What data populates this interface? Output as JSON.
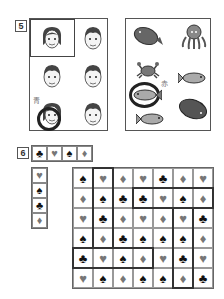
{
  "section5": {
    "number": "5",
    "faces_panel": {
      "highlighted_cell": "top-left woman",
      "faces": [
        {
          "id": "woman",
          "row": 1,
          "col": 1
        },
        {
          "id": "man",
          "row": 1,
          "col": 2
        },
        {
          "id": "man",
          "row": 2,
          "col": 1
        },
        {
          "id": "man",
          "row": 2,
          "col": 2
        },
        {
          "id": "woman-circled",
          "row": 3,
          "col": 1
        },
        {
          "id": "man",
          "row": 3,
          "col": 2
        }
      ],
      "circle_label": "青"
    },
    "sea_panel": {
      "creatures": [
        {
          "id": "flatfish",
          "pos": "top-left"
        },
        {
          "id": "octopus",
          "pos": "top-right"
        },
        {
          "id": "crab",
          "pos": "middle-left"
        },
        {
          "id": "fish",
          "pos": "middle-right"
        },
        {
          "id": "fish-circled",
          "pos": "lower-left"
        },
        {
          "id": "flatfish-dark",
          "pos": "lower-right"
        },
        {
          "id": "fish",
          "pos": "bottom-left"
        }
      ],
      "circle_label": "赤"
    }
  },
  "section6": {
    "number": "6",
    "top_strip": [
      "♣",
      "♥",
      "♠",
      "♦"
    ],
    "left_strip": [
      "♥",
      "♠",
      "♣",
      "♦"
    ],
    "grid": [
      [
        "♠",
        "♥",
        "♦",
        "♥",
        "♣",
        "♦",
        "♥"
      ],
      [
        "♦",
        "♠",
        "♣",
        "♣",
        "♥",
        "♠",
        "♦"
      ],
      [
        "♥",
        "♣",
        "♦",
        "♥",
        "♦",
        "♥",
        "♣"
      ],
      [
        "♠",
        "♦",
        "♣",
        "♠",
        "♠",
        "♠",
        "♦"
      ],
      [
        "♣",
        "♥",
        "♠",
        "♦",
        "♥",
        "♣",
        "♥"
      ],
      [
        "♥",
        "♠",
        "♦",
        "♠",
        "♠",
        "♦",
        "♣"
      ]
    ],
    "highlights": [
      {
        "orientation": "vertical",
        "col": 2,
        "rows": [
          1,
          4
        ]
      },
      {
        "orientation": "horizontal",
        "row": 2,
        "cols": [
          4,
          7
        ]
      },
      {
        "orientation": "vertical",
        "col": 6,
        "rows": [
          3,
          6
        ]
      },
      {
        "orientation": "horizontal",
        "row": 5,
        "cols": [
          1,
          4
        ]
      }
    ]
  },
  "colors": {
    "dark_suit": "#111111",
    "gray_suit": "#777777",
    "border": "#555555",
    "highlight": "#333333"
  }
}
